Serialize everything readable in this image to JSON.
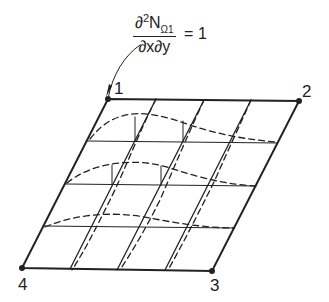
{
  "formula": {
    "numerator": "∂",
    "power": "2",
    "symbol": "N",
    "subscript": "Ω1",
    "denominator": "∂x∂y",
    "equals": "= 1"
  },
  "nodes": [
    {
      "id": "1",
      "label": "1"
    },
    {
      "id": "2",
      "label": "2"
    },
    {
      "id": "3",
      "label": "3"
    },
    {
      "id": "4",
      "label": "4"
    }
  ],
  "colors": {
    "line": "#222222",
    "background": "#ffffff"
  }
}
